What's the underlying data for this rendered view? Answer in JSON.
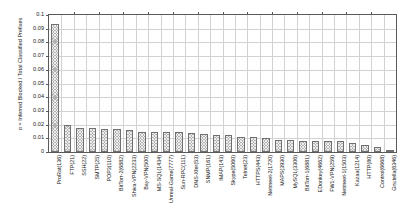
{
  "chart_data": {
    "type": "bar",
    "title": "",
    "subtitle": "",
    "xlabel": "",
    "ylabel": "α = Inferred Blocked / Total Classified Prefixes",
    "ylim": [
      0,
      0.1
    ],
    "yticks": [
      "0",
      "0.01",
      "0.02",
      "0.03",
      "0.04",
      "0.05",
      "0.06",
      "0.07",
      "0.08",
      "0.09",
      "0.1"
    ],
    "ytick_values": [
      0,
      0.01,
      0.02,
      0.03,
      0.04,
      0.05,
      0.06,
      0.07,
      0.08,
      0.09,
      0.1
    ],
    "grid": true,
    "legend": "none",
    "bar_color": "#b3b3b3",
    "bar_edge_color": "#6f6f6f",
    "categories": [
      "ProRat(136)",
      "FTP(21)",
      "SSH(22)",
      "SMTP(25)",
      "POP3(110)",
      "BitTorr-2(6882)",
      "Shiva-VPN(2233)",
      "Bay-VPN(500)",
      "MS-SQL(1434)",
      "Unreal-Game(7777)",
      "Sun-RPC(111)",
      "DNS-Xfer(53)",
      "SNMP(161)",
      "IMAP(143)",
      "Skype(5060)",
      "Telnet(23)",
      "HTTPS(443)",
      "Netmeet-2(1720)",
      "MAPS(3930)",
      "MySQL(3306)",
      "BitTorr-1(6881)",
      "EDonkey(4662)",
      "FW1-VPN(259)",
      "Netmeet-1(1503)",
      "Kazaa(1214)",
      "HTTP(80)",
      "Control(6668)",
      "Gnutella(6346)"
    ],
    "values": [
      0.0932,
      0.02,
      0.0175,
      0.0175,
      0.017,
      0.0165,
      0.016,
      0.0147,
      0.0145,
      0.0145,
      0.0145,
      0.0139,
      0.0129,
      0.0126,
      0.0122,
      0.0112,
      0.0112,
      0.01,
      0.0087,
      0.0087,
      0.0084,
      0.0084,
      0.008,
      0.008,
      0.0067,
      0.0051,
      0.004,
      0.0004
    ]
  }
}
